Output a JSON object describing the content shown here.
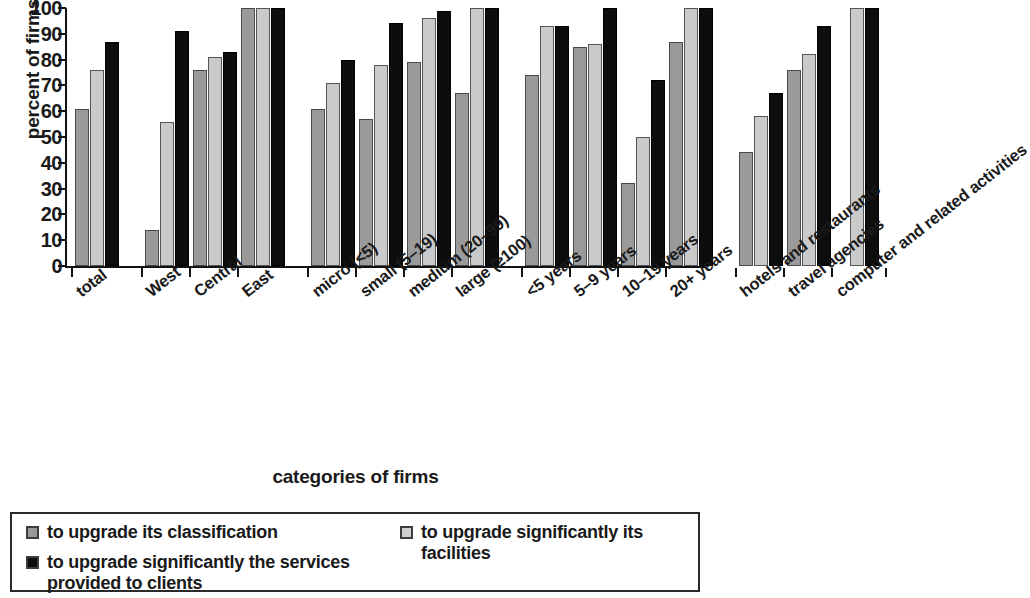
{
  "chart_data": {
    "type": "bar",
    "title": "",
    "xlabel": "categories of firms",
    "ylabel": "percent of firms",
    "ylim": [
      0,
      100
    ],
    "yticks": [
      0,
      10,
      20,
      30,
      40,
      50,
      60,
      70,
      80,
      90,
      100
    ],
    "grid": false,
    "legend_position": "bottom",
    "categories": [
      "total",
      "West",
      "Central",
      "East",
      "micro (<5)",
      "small (5–19)",
      "medium (20–99)",
      "large (≥100)",
      "<5 years",
      "5–9 years",
      "10–19 years",
      "20+ years",
      "hotels and restaurants",
      "travel agencies",
      "computer and related activities"
    ],
    "group_breaks_after": [
      "total",
      "East",
      "large (≥100)",
      "20+ years"
    ],
    "series": [
      {
        "name": "to upgrade its classification",
        "color": "#9a9a9a",
        "values": [
          61,
          14,
          76,
          100,
          61,
          57,
          79,
          67,
          74,
          85,
          32,
          87,
          44,
          76,
          null
        ]
      },
      {
        "name": "to upgrade significantly its facilities",
        "color": "#cacaca",
        "values": [
          76,
          56,
          81,
          100,
          71,
          78,
          96,
          100,
          93,
          86,
          50,
          100,
          58,
          82,
          100
        ]
      },
      {
        "name": "to upgrade significantly the services provided to clients",
        "color": "#0d0d0d",
        "values": [
          87,
          91,
          83,
          100,
          80,
          94,
          99,
          100,
          93,
          100,
          72,
          100,
          67,
          93,
          100
        ]
      }
    ]
  },
  "legend": {
    "entries": [
      {
        "label": "to upgrade its classification",
        "swatch": "s0"
      },
      {
        "label": "to upgrade significantly its facilities",
        "swatch": "s1"
      },
      {
        "label": "to upgrade significantly the services",
        "label2": "provided to clients",
        "swatch": "s2"
      }
    ]
  }
}
